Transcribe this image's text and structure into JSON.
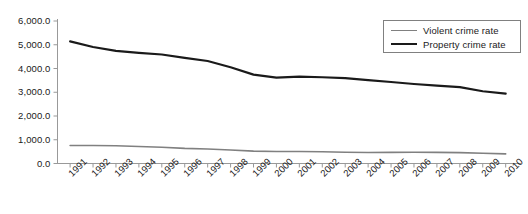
{
  "chart_data": {
    "type": "line",
    "title": "",
    "subtitle": "",
    "xlabel": "",
    "ylabel": "",
    "grid": false,
    "legend_position": "top-right",
    "xlim": [
      "1991",
      "2010"
    ],
    "ylim": [
      0,
      6000
    ],
    "categories": [
      "1991",
      "1992",
      "1993",
      "1994",
      "1995",
      "1996",
      "1997",
      "1998",
      "1999",
      "2000",
      "2001",
      "2002",
      "2003",
      "2004",
      "2005",
      "2006",
      "2007",
      "2008",
      "2009",
      "2010"
    ],
    "ytick_labels": [
      "0.0",
      "1,000.0",
      "2,000.0",
      "3,000.0",
      "4,000.0",
      "5,000.0",
      "6,000.0"
    ],
    "ytick_values": [
      0,
      1000,
      2000,
      3000,
      4000,
      5000,
      6000
    ],
    "series": [
      {
        "name": "Violent crime rate",
        "color": "#808080",
        "values": [
          758.2,
          757.7,
          747.1,
          713.6,
          684.5,
          636.6,
          611.0,
          567.6,
          523.0,
          506.5,
          504.5,
          494.4,
          475.8,
          463.2,
          469.0,
          473.6,
          466.9,
          458.6,
          431.9,
          404.5
        ]
      },
      {
        "name": "Property crime rate",
        "color": "#1a1a1a",
        "values": [
          5140.2,
          4903.7,
          4740.0,
          4660.2,
          4590.5,
          4451.0,
          4316.3,
          4052.5,
          3743.6,
          3618.3,
          3658.1,
          3630.6,
          3591.2,
          3514.1,
          3431.5,
          3346.6,
          3276.4,
          3214.6,
          3041.3,
          2941.9
        ]
      }
    ]
  },
  "legend": {
    "items": [
      {
        "label": "Violent crime rate",
        "color": "#808080"
      },
      {
        "label": "Property crime rate",
        "color": "#1a1a1a"
      }
    ]
  },
  "axes": {
    "y_axis_color": "#999999",
    "x_axis_color": "#999999"
  }
}
